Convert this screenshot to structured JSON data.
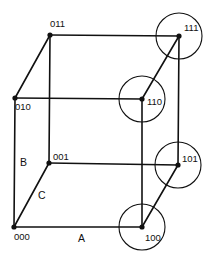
{
  "diagram": {
    "type": "boolean-cube",
    "vertices": [
      {
        "id": "000",
        "label": "000",
        "x": 14,
        "y": 227,
        "circled": false,
        "lx": 14,
        "ly": 240
      },
      {
        "id": "001",
        "label": "001",
        "x": 49,
        "y": 163,
        "circled": false,
        "lx": 53,
        "ly": 160
      },
      {
        "id": "010",
        "label": "010",
        "x": 15,
        "y": 98,
        "circled": false,
        "lx": 15,
        "ly": 110
      },
      {
        "id": "011",
        "label": "011",
        "x": 50,
        "y": 35,
        "circled": false,
        "lx": 50,
        "ly": 27
      },
      {
        "id": "100",
        "label": "100",
        "x": 142,
        "y": 227,
        "circled": true,
        "lx": 145,
        "ly": 241
      },
      {
        "id": "101",
        "label": "101",
        "x": 178,
        "y": 165,
        "circled": true,
        "lx": 182,
        "ly": 162
      },
      {
        "id": "110",
        "label": "110",
        "x": 142,
        "y": 99,
        "circled": true,
        "lx": 147,
        "ly": 105
      },
      {
        "id": "111",
        "label": "111",
        "x": 179,
        "y": 36,
        "circled": true,
        "lx": 184,
        "ly": 31
      }
    ],
    "edges": [
      [
        "000",
        "100"
      ],
      [
        "000",
        "010"
      ],
      [
        "000",
        "001"
      ],
      [
        "010",
        "110"
      ],
      [
        "010",
        "011"
      ],
      [
        "001",
        "101"
      ],
      [
        "001",
        "011"
      ],
      [
        "011",
        "111"
      ],
      [
        "100",
        "110"
      ],
      [
        "100",
        "101"
      ],
      [
        "110",
        "111"
      ],
      [
        "101",
        "111"
      ]
    ],
    "circle_radius": 23,
    "axis_labels": [
      {
        "id": "A",
        "text": "A",
        "x": 78,
        "y": 242
      },
      {
        "id": "B",
        "text": "B",
        "x": 20,
        "y": 166
      },
      {
        "id": "C",
        "text": "C",
        "x": 38,
        "y": 199
      }
    ],
    "colors": {
      "stroke": "#111111",
      "background": "#ffffff"
    }
  }
}
